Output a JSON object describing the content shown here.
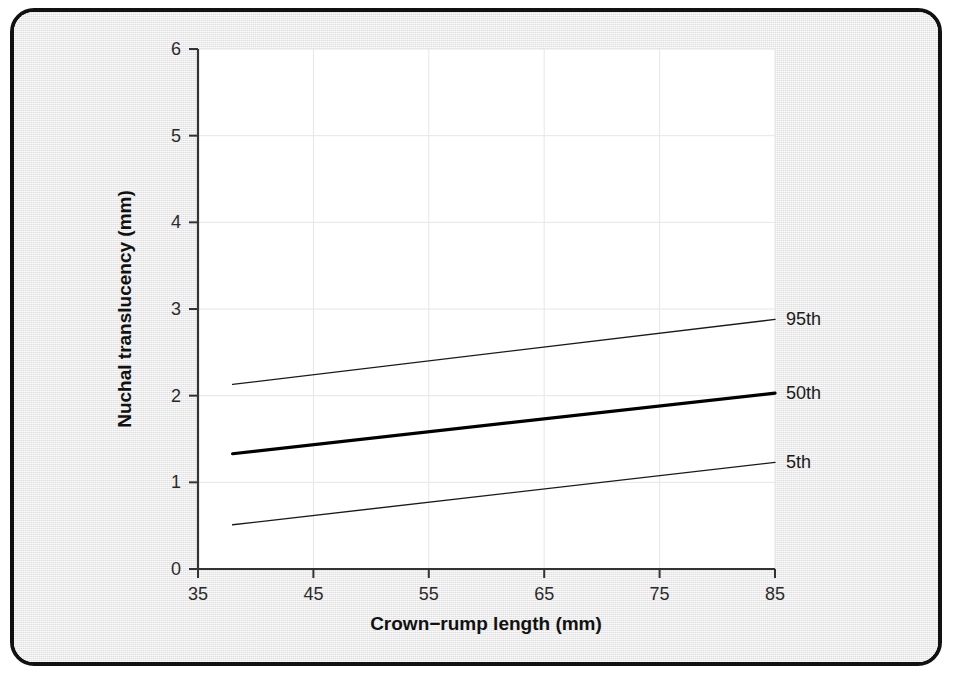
{
  "figure": {
    "frame_border_color": "#111111",
    "paper_color": "#eeeeee",
    "plot_background_color": "#ffffff",
    "gridline_color": "#e6e6e6",
    "axis_color": "#333333"
  },
  "chart_data": {
    "type": "line",
    "title": "",
    "subtitle": "",
    "xlabel": "Crown−rump length (mm)",
    "ylabel": "Nuchal translucency (mm)",
    "xlim": [
      35,
      85
    ],
    "ylim": [
      0,
      6
    ],
    "xticks": [
      35,
      45,
      55,
      65,
      75,
      85
    ],
    "xtick_labels": [
      "35",
      "45",
      "55",
      "65",
      "75",
      "85"
    ],
    "yticks": [
      0,
      1,
      2,
      3,
      4,
      5,
      6
    ],
    "ytick_labels": [
      "0",
      "1",
      "2",
      "3",
      "4",
      "5",
      "6"
    ],
    "grid": true,
    "grid_axes": "both",
    "legend_position": "right-of-line-ends",
    "x": [
      38,
      85
    ],
    "series": [
      {
        "name": "95th",
        "label": "95th",
        "values": [
          2.13,
          2.88
        ],
        "color": "#1a1a1a",
        "line_width": 1.4
      },
      {
        "name": "50th",
        "label": "50th",
        "values": [
          1.33,
          2.03
        ],
        "color": "#000000",
        "line_width": 3.2
      },
      {
        "name": "5th",
        "label": "5th",
        "values": [
          0.51,
          1.23
        ],
        "color": "#1a1a1a",
        "line_width": 1.4
      }
    ],
    "annotations": []
  }
}
